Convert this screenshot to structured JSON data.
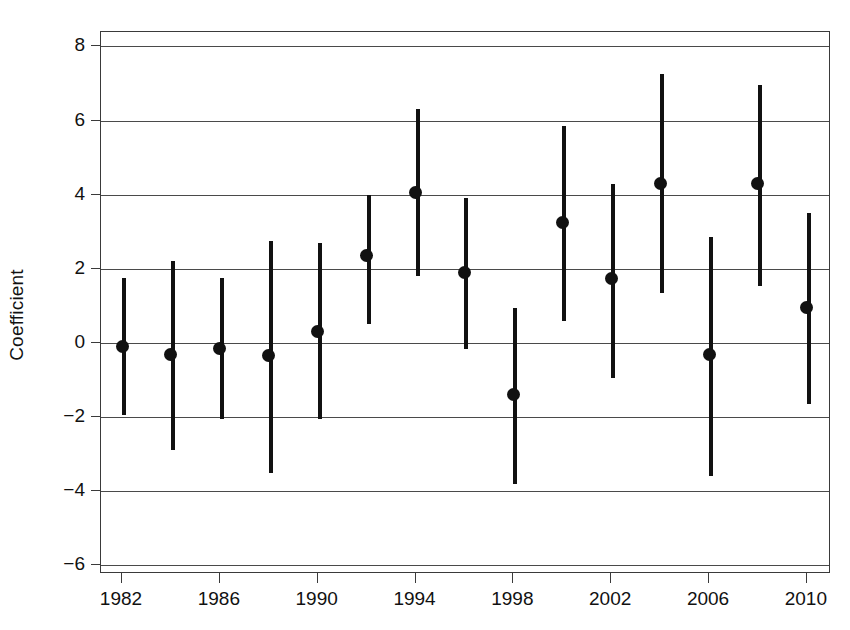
{
  "chart_data": {
    "type": "scatter",
    "title": "",
    "subtitle": "",
    "xlabel": "",
    "ylabel": "Coefficient",
    "grid": true,
    "legend": null,
    "xlim": [
      1980.8,
      2011.0
    ],
    "ylim": [
      -6.6,
      8.6
    ],
    "xticks": [
      1982,
      1986,
      1990,
      1994,
      1998,
      2002,
      2006,
      2010
    ],
    "yticks": [
      8,
      6,
      4,
      2,
      0,
      -2,
      -4,
      -6
    ],
    "ytick_labels": [
      "8",
      "6",
      "4",
      "2",
      "0",
      "−2",
      "−4",
      "−6"
    ],
    "xtick_labels": [
      "1982",
      "1986",
      "1990",
      "1994",
      "1998",
      "2002",
      "2006",
      "2010"
    ],
    "marker": "filled-circle",
    "errorbar_style": "vertical-line",
    "x": [
      1982,
      1984,
      1986,
      1988,
      1990,
      1992,
      1994,
      1996,
      1998,
      2000,
      2002,
      2004,
      2006,
      2008,
      2010
    ],
    "values": [
      -0.1,
      -0.3,
      -0.15,
      -0.35,
      0.3,
      2.35,
      4.05,
      1.9,
      -1.4,
      3.25,
      1.75,
      4.3,
      -0.3,
      4.3,
      0.95
    ],
    "ci_lower": [
      -1.95,
      -2.9,
      -2.05,
      -3.5,
      -2.05,
      0.5,
      1.8,
      -0.15,
      -3.8,
      0.6,
      -0.95,
      1.35,
      -3.6,
      1.55,
      -1.65
    ],
    "ci_upper": [
      1.75,
      2.2,
      1.75,
      2.75,
      2.7,
      4.0,
      6.3,
      3.9,
      0.95,
      5.85,
      4.3,
      7.25,
      2.85,
      6.95,
      3.5
    ],
    "series": [
      {
        "name": "Coefficient",
        "values": [
          -0.1,
          -0.3,
          -0.15,
          -0.35,
          0.3,
          2.35,
          4.05,
          1.9,
          -1.4,
          3.25,
          1.75,
          4.3,
          -0.3,
          4.3,
          0.95
        ]
      }
    ],
    "colors": {
      "marker": "#111111",
      "errorbar": "#111111",
      "grid": "#4a4a4a",
      "axis": "#3a3a3a",
      "background": "#ffffff"
    }
  }
}
